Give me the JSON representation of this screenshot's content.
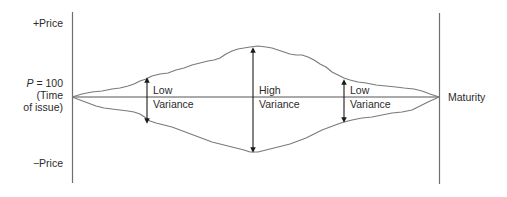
{
  "diagram": {
    "type": "bond-price-variance-envelope",
    "axis_labels": {
      "top": "+Price",
      "bottom": "−Price",
      "par_symbol": "P",
      "par_value": "= 100",
      "par_note_line1": "(Time",
      "par_note_line2": "of issue)",
      "right": "Maturity"
    },
    "regions": [
      {
        "id": "early",
        "line1": "Low",
        "line2": "Variance"
      },
      {
        "id": "middle",
        "line1": "High",
        "line2": "Variance"
      },
      {
        "id": "late",
        "line1": "Low",
        "line2": "Variance"
      }
    ],
    "colors": {
      "line": "#7a7a7a",
      "axis": "#6e6e6e",
      "arrow": "#1a1a1a",
      "text": "#2b2b2b"
    }
  }
}
